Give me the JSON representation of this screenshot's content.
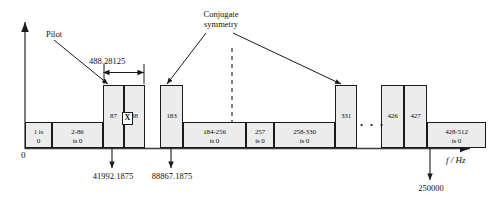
{
  "figure": {
    "axis": {
      "x_axis_label": "f / Hz",
      "origin_label": "0",
      "y_axis_name": "vertical-axis",
      "x_axis_name": "horizontal-frequency-axis"
    },
    "annotations": {
      "pilot": "Pilot",
      "conjugate_symmetry_line1": "Conjugate",
      "conjugate_symmetry_line2": "symmetry",
      "subcarrier_spacing": "488.28125",
      "ellipsis": ". . .",
      "x_marker": "X"
    },
    "frequency_callouts": [
      {
        "value": "41992.1875",
        "target_bin": "87"
      },
      {
        "value": "88867.1875",
        "target_bin": "183"
      },
      {
        "value": "250000",
        "target_bin": "428-512"
      }
    ],
    "bins": [
      {
        "id": "bin-1",
        "label_line1": "1 is",
        "label_line2": "0",
        "height": "short",
        "x": 25,
        "w": 27
      },
      {
        "id": "bin-2-86",
        "label_line1": "2-86",
        "label_line2": "is 0",
        "height": "short",
        "x": 52,
        "w": 51
      },
      {
        "id": "bin-87",
        "label_line1": "87",
        "label_line2": "",
        "height": "tall",
        "x": 103,
        "w": 21
      },
      {
        "id": "bin-88",
        "label_line1": "88",
        "label_line2": "",
        "height": "tall",
        "x": 124,
        "w": 21
      },
      {
        "id": "bin-183",
        "label_line1": "183",
        "label_line2": "",
        "height": "tall",
        "x": 160,
        "w": 23
      },
      {
        "id": "bin-184-256",
        "label_line1": "184-256",
        "label_line2": "is 0",
        "height": "short",
        "x": 183,
        "w": 63
      },
      {
        "id": "bin-257",
        "label_line1": "257",
        "label_line2": "is 0",
        "height": "short",
        "x": 246,
        "w": 28
      },
      {
        "id": "bin-258-330",
        "label_line1": "258-330",
        "label_line2": "is 0",
        "height": "short",
        "x": 274,
        "w": 61
      },
      {
        "id": "bin-331",
        "label_line1": "331",
        "label_line2": "",
        "height": "tall",
        "x": 335,
        "w": 22
      },
      {
        "id": "bin-426",
        "label_line1": "426",
        "label_line2": "",
        "height": "tall",
        "x": 381,
        "w": 23
      },
      {
        "id": "bin-427",
        "label_line1": "427",
        "label_line2": "",
        "height": "tall",
        "x": 404,
        "w": 23
      },
      {
        "id": "bin-428-512",
        "label_line1": "428-512",
        "label_line2": "is 0",
        "height": "short",
        "x": 427,
        "w": 59
      }
    ]
  }
}
